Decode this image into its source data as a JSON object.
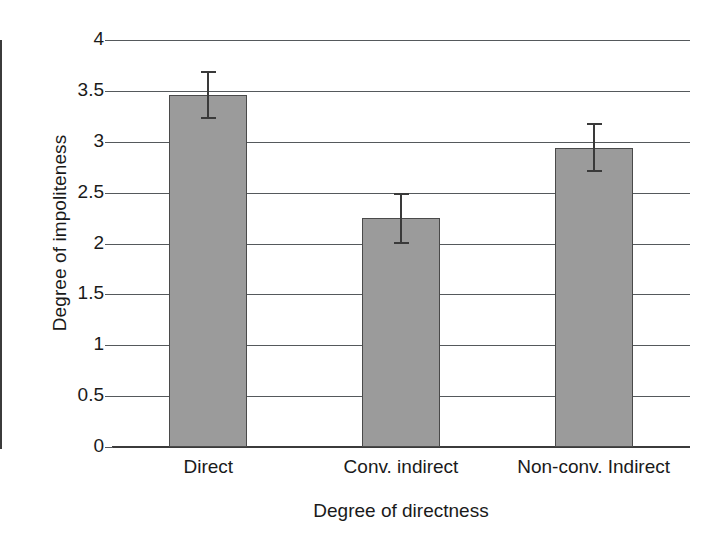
{
  "chart_data": {
    "type": "bar",
    "title": "",
    "xlabel": "Degree of directness",
    "ylabel": "Degree of impoliteness",
    "categories": [
      "Direct",
      "Conv. indirect",
      "Non-conv. Indirect"
    ],
    "values": [
      3.46,
      2.25,
      2.94
    ],
    "errors": [
      0.24,
      0.25,
      0.24
    ],
    "error_low": [
      3.22,
      2.0,
      2.7
    ],
    "error_high": [
      3.7,
      2.5,
      3.18
    ],
    "ylim": [
      0,
      4
    ],
    "yticks": [
      0,
      0.5,
      1,
      1.5,
      2,
      2.5,
      3,
      3.5,
      4
    ],
    "ytick_labels": [
      "0",
      "0.5",
      "1",
      "1.5",
      "2",
      "2.5",
      "3",
      "3.5",
      "4"
    ],
    "grid": "horizontal",
    "legend": "none",
    "bar_color": "#9b9b9b",
    "bar_border_color": "#4a4a4a",
    "gridline_color": "#55595c",
    "axis_color": "#3b3b3b",
    "error_color": "#3a3a3a",
    "background": "#ffffff"
  }
}
